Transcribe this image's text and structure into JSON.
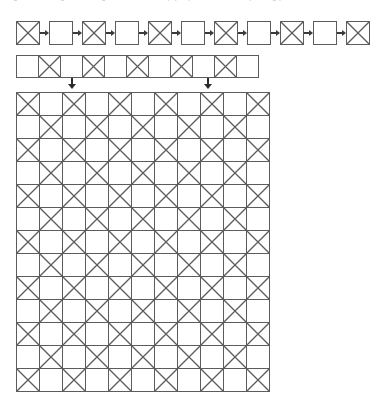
{
  "caption": {
    "text": "diagram showing alternating crossed and empty square tiles in a repeating pattern"
  },
  "sequence_row": {
    "name": "alternating-box-chain",
    "arrow_glyph": "right-arrow",
    "items": [
      {
        "type": "box",
        "filled": "x"
      },
      {
        "type": "arrow"
      },
      {
        "type": "box",
        "filled": "empty"
      },
      {
        "type": "arrow"
      },
      {
        "type": "box",
        "filled": "x"
      },
      {
        "type": "arrow"
      },
      {
        "type": "box",
        "filled": "empty"
      },
      {
        "type": "arrow"
      },
      {
        "type": "box",
        "filled": "x"
      },
      {
        "type": "arrow"
      },
      {
        "type": "box",
        "filled": "empty"
      },
      {
        "type": "arrow"
      },
      {
        "type": "box",
        "filled": "x"
      },
      {
        "type": "arrow"
      },
      {
        "type": "box",
        "filled": "empty"
      },
      {
        "type": "arrow"
      },
      {
        "type": "box",
        "filled": "x"
      },
      {
        "type": "arrow"
      },
      {
        "type": "box",
        "filled": "empty"
      },
      {
        "type": "arrow"
      },
      {
        "type": "box",
        "filled": "x"
      }
    ]
  },
  "strip_row": {
    "name": "tile-strip",
    "cells": [
      "empty",
      "x",
      "empty",
      "x",
      "empty",
      "x",
      "empty",
      "x",
      "empty",
      "x",
      "empty"
    ]
  },
  "connectors": {
    "glyph": "down-arrow",
    "arrows": [
      {
        "label": "connector-left",
        "x": 67
      },
      {
        "label": "connector-right",
        "x": 203
      }
    ]
  },
  "main_grid": {
    "name": "checkerboard-grid",
    "columns": 11,
    "rows": 13,
    "cell_size": 24,
    "rows_data": [
      [
        "x",
        "empty",
        "x",
        "empty",
        "x",
        "empty",
        "x",
        "empty",
        "x",
        "empty",
        "x"
      ],
      [
        "empty",
        "x",
        "empty",
        "x",
        "empty",
        "x",
        "empty",
        "x",
        "empty",
        "x",
        "empty"
      ],
      [
        "x",
        "empty",
        "x",
        "empty",
        "x",
        "empty",
        "x",
        "empty",
        "x",
        "empty",
        "x"
      ],
      [
        "empty",
        "x",
        "empty",
        "x",
        "empty",
        "x",
        "empty",
        "x",
        "empty",
        "x",
        "empty"
      ],
      [
        "x",
        "empty",
        "x",
        "empty",
        "x",
        "empty",
        "x",
        "empty",
        "x",
        "empty",
        "x"
      ],
      [
        "empty",
        "x",
        "empty",
        "x",
        "empty",
        "x",
        "empty",
        "x",
        "empty",
        "x",
        "empty"
      ],
      [
        "x",
        "empty",
        "x",
        "empty",
        "x",
        "empty",
        "x",
        "empty",
        "x",
        "empty",
        "x"
      ],
      [
        "empty",
        "x",
        "empty",
        "x",
        "empty",
        "x",
        "empty",
        "x",
        "empty",
        "x",
        "empty"
      ],
      [
        "x",
        "empty",
        "x",
        "empty",
        "x",
        "empty",
        "x",
        "empty",
        "x",
        "empty",
        "x"
      ],
      [
        "empty",
        "x",
        "empty",
        "x",
        "empty",
        "x",
        "empty",
        "x",
        "empty",
        "x",
        "empty"
      ],
      [
        "x",
        "empty",
        "x",
        "empty",
        "x",
        "empty",
        "x",
        "empty",
        "x",
        "empty",
        "x"
      ],
      [
        "empty",
        "x",
        "empty",
        "x",
        "empty",
        "x",
        "empty",
        "x",
        "empty",
        "x",
        "empty"
      ],
      [
        "x",
        "empty",
        "x",
        "empty",
        "x",
        "empty",
        "x",
        "empty",
        "x",
        "empty",
        "x"
      ]
    ]
  },
  "colors": {
    "stroke": "#5c5c5c",
    "arrow": "#2b2b2b",
    "background": "#ffffff",
    "caption": "#c9c9c9"
  }
}
